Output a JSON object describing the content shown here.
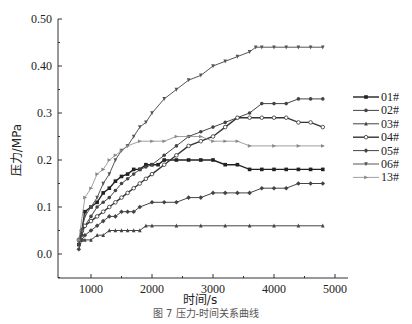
{
  "chart_data": {
    "type": "line",
    "title": "",
    "xlabel": "时间/s",
    "ylabel": "压力/MPa",
    "xlim": [
      500,
      5400
    ],
    "ylim": [
      -0.05,
      0.5
    ],
    "xticks": [
      1000,
      2000,
      3000,
      4000,
      5000
    ],
    "xtick_labels": [
      "1000",
      "2000",
      "3000",
      "4000",
      "5000"
    ],
    "yticks": [
      0.0,
      0.1,
      0.2,
      0.3,
      0.4,
      0.5
    ],
    "ytick_labels": [
      "0.0",
      "0.1",
      "0.2",
      "0.3",
      "0.40",
      "0.50"
    ],
    "grid": false,
    "legend_position": "right",
    "series": [
      {
        "name": "01#",
        "marker": "square",
        "color": "#222222",
        "width": 1.4,
        "x": [
          800,
          850,
          900,
          1000,
          1100,
          1200,
          1300,
          1400,
          1500,
          1600,
          1700,
          1800,
          1900,
          2000,
          2100,
          2200,
          2400,
          2600,
          2800,
          3000,
          3200,
          3400,
          3600,
          3800,
          4000,
          4200,
          4400,
          4600,
          4800
        ],
        "y": [
          0.02,
          0.05,
          0.09,
          0.1,
          0.11,
          0.13,
          0.14,
          0.155,
          0.165,
          0.17,
          0.18,
          0.18,
          0.19,
          0.19,
          0.19,
          0.2,
          0.2,
          0.2,
          0.2,
          0.2,
          0.19,
          0.19,
          0.18,
          0.18,
          0.18,
          0.18,
          0.18,
          0.18,
          0.18
        ]
      },
      {
        "name": "02#",
        "marker": "circle",
        "color": "#444444",
        "width": 1.0,
        "x": [
          800,
          850,
          900,
          1000,
          1100,
          1200,
          1300,
          1400,
          1500,
          1600,
          1700,
          1800,
          1900,
          2000,
          2200,
          2400,
          2600,
          2800,
          3000,
          3200,
          3400,
          3600,
          3800,
          4000,
          4200,
          4400,
          4600,
          4800
        ],
        "y": [
          0.02,
          0.04,
          0.06,
          0.08,
          0.1,
          0.11,
          0.12,
          0.135,
          0.15,
          0.16,
          0.17,
          0.18,
          0.185,
          0.19,
          0.21,
          0.23,
          0.25,
          0.26,
          0.27,
          0.28,
          0.29,
          0.3,
          0.32,
          0.32,
          0.32,
          0.33,
          0.33,
          0.33
        ]
      },
      {
        "name": "03#",
        "marker": "triangle-up",
        "color": "#444444",
        "width": 1.0,
        "x": [
          800,
          850,
          900,
          1000,
          1100,
          1200,
          1300,
          1400,
          1500,
          1600,
          1700,
          1800,
          1900,
          2000,
          2400,
          2800,
          3200,
          3600,
          4000,
          4400,
          4800
        ],
        "y": [
          0.03,
          0.03,
          0.03,
          0.03,
          0.04,
          0.04,
          0.05,
          0.05,
          0.05,
          0.05,
          0.05,
          0.05,
          0.06,
          0.06,
          0.06,
          0.06,
          0.06,
          0.06,
          0.06,
          0.06,
          0.06
        ]
      },
      {
        "name": "04#",
        "marker": "circle-open",
        "color": "#333333",
        "width": 1.4,
        "x": [
          800,
          850,
          900,
          1000,
          1100,
          1200,
          1300,
          1400,
          1500,
          1600,
          1700,
          1800,
          1900,
          2000,
          2200,
          2400,
          2600,
          2800,
          3000,
          3200,
          3400,
          3600,
          3800,
          4000,
          4200,
          4400,
          4600,
          4800
        ],
        "y": [
          0.03,
          0.05,
          0.06,
          0.07,
          0.08,
          0.09,
          0.1,
          0.11,
          0.12,
          0.13,
          0.14,
          0.15,
          0.16,
          0.17,
          0.19,
          0.21,
          0.23,
          0.24,
          0.25,
          0.27,
          0.29,
          0.29,
          0.29,
          0.29,
          0.29,
          0.28,
          0.28,
          0.27
        ]
      },
      {
        "name": "05#",
        "marker": "diamond",
        "color": "#444444",
        "width": 1.0,
        "x": [
          800,
          850,
          900,
          1000,
          1100,
          1200,
          1300,
          1400,
          1500,
          1600,
          1700,
          1800,
          2000,
          2200,
          2400,
          2600,
          2800,
          3000,
          3200,
          3400,
          3600,
          3800,
          4000,
          4200,
          4400,
          4600,
          4800
        ],
        "y": [
          0.01,
          0.03,
          0.04,
          0.05,
          0.06,
          0.07,
          0.08,
          0.08,
          0.09,
          0.09,
          0.09,
          0.1,
          0.11,
          0.11,
          0.11,
          0.12,
          0.12,
          0.13,
          0.13,
          0.13,
          0.13,
          0.14,
          0.14,
          0.14,
          0.15,
          0.15,
          0.15
        ]
      },
      {
        "name": "06#",
        "marker": "triangle-down",
        "color": "#555555",
        "width": 1.0,
        "x": [
          800,
          850,
          900,
          1000,
          1100,
          1200,
          1300,
          1400,
          1500,
          1600,
          1700,
          1800,
          1900,
          2000,
          2200,
          2400,
          2600,
          2800,
          3000,
          3200,
          3400,
          3600,
          3700,
          3800,
          4000,
          4200,
          4400,
          4600,
          4800
        ],
        "y": [
          0.03,
          0.05,
          0.08,
          0.1,
          0.12,
          0.15,
          0.17,
          0.2,
          0.22,
          0.23,
          0.25,
          0.27,
          0.28,
          0.3,
          0.33,
          0.35,
          0.37,
          0.38,
          0.4,
          0.41,
          0.42,
          0.43,
          0.44,
          0.44,
          0.44,
          0.44,
          0.44,
          0.44,
          0.44
        ]
      },
      {
        "name": "13#",
        "marker": "triangle-right",
        "color": "#888888",
        "width": 0.8,
        "x": [
          800,
          900,
          1000,
          1100,
          1200,
          1300,
          1400,
          1500,
          1600,
          1800,
          2000,
          2200,
          2400,
          2600,
          2800,
          3000,
          3200,
          3400,
          3600,
          4000,
          4400,
          4800
        ],
        "y": [
          0.03,
          0.12,
          0.14,
          0.17,
          0.18,
          0.2,
          0.21,
          0.22,
          0.23,
          0.24,
          0.24,
          0.24,
          0.25,
          0.25,
          0.25,
          0.24,
          0.24,
          0.24,
          0.23,
          0.23,
          0.23,
          0.23
        ]
      }
    ]
  },
  "caption": "图 7  压力-时间关系曲线"
}
